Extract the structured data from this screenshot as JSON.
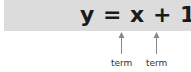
{
  "equation": "y = x + 1",
  "annotations": [
    {
      "label": "term",
      "target": "x"
    },
    {
      "label": "term",
      "target": "1"
    }
  ],
  "colors": {
    "band": "#dcdcdc",
    "text": "#1a1a1a",
    "arrow": "#888888"
  }
}
